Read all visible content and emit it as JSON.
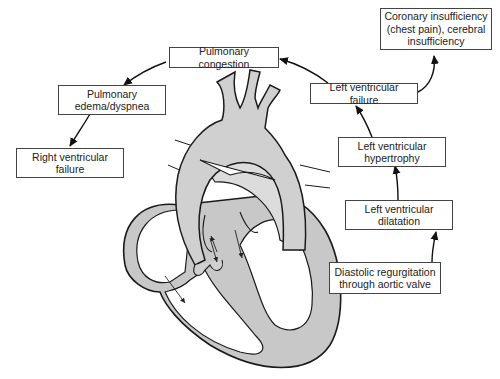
{
  "diagram": {
    "nodes": [
      {
        "id": "coronary",
        "label": "Coronary insufficiency\n(chest pain), cerebral\ninsufficiency"
      },
      {
        "id": "pulm_congestion",
        "label": "Pulmonary congestion"
      },
      {
        "id": "pulm_edema",
        "label": "Pulmonary\nedema/dyspnea"
      },
      {
        "id": "rv_failure",
        "label": "Right ventricular\nfailure"
      },
      {
        "id": "lv_failure",
        "label": "Left ventricular failure"
      },
      {
        "id": "lv_hypertrophy",
        "label": "Left ventricular\nhypertrophy"
      },
      {
        "id": "lv_dilatation",
        "label": "Left ventricular\ndilatation"
      },
      {
        "id": "regurgitation",
        "label": "Diastolic regurgitation\nthrough aortic valve"
      }
    ],
    "edges": [
      {
        "from": "regurgitation",
        "to": "lv_dilatation"
      },
      {
        "from": "lv_dilatation",
        "to": "lv_hypertrophy"
      },
      {
        "from": "lv_hypertrophy",
        "to": "lv_failure"
      },
      {
        "from": "lv_failure",
        "to": "coronary"
      },
      {
        "from": "lv_failure",
        "to": "pulm_congestion"
      },
      {
        "from": "pulm_congestion",
        "to": "pulm_edema"
      },
      {
        "from": "pulm_edema",
        "to": "rv_failure"
      }
    ],
    "illustration": "heart-cross-section-with-aorta",
    "colors": {
      "fill": "#c8c8c8",
      "light_fill": "#dcdcdc",
      "line": "#1a1a1a",
      "box_border": "#444444"
    }
  }
}
